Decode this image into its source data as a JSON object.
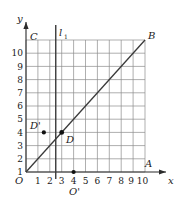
{
  "figure": {
    "axes": {
      "x_label": "x",
      "y_label": "y",
      "origin_label": "O",
      "x_ticks": [
        "1",
        "2",
        "3",
        "4",
        "5",
        "6",
        "7",
        "8",
        "9",
        "10"
      ],
      "y_ticks": [
        "1",
        "2",
        "3",
        "4",
        "5",
        "6",
        "7",
        "8",
        "9",
        "10"
      ],
      "x_range": [
        0,
        10
      ],
      "y_range": [
        0,
        10
      ]
    },
    "grid": {
      "color": "#8c8c8c",
      "spacing": 1,
      "visible": true
    },
    "lines": [
      {
        "name": "diagonal-line",
        "label": "",
        "from": [
          0,
          0
        ],
        "to": [
          10,
          10
        ],
        "color": "#3a3a3a"
      },
      {
        "name": "vertical-line-l1",
        "label": "l₁",
        "label_text": "l",
        "label_sub": "1",
        "x": 2.5,
        "from_y": 0,
        "to_y": 11.4,
        "color": "#3a3a3a"
      }
    ],
    "points": [
      {
        "name": "point-C",
        "label": "C",
        "x": 0,
        "y": 10,
        "marker": false,
        "label_dx": 4,
        "label_dy": -1
      },
      {
        "name": "point-B",
        "label": "B",
        "x": 10,
        "y": 10,
        "marker": false,
        "label_dx": 4,
        "label_dy": -2
      },
      {
        "name": "point-A",
        "label": "A",
        "x": 10,
        "y": 0.7,
        "marker": false,
        "label_dx": 2,
        "label_dy": 0
      },
      {
        "name": "point-D-prime",
        "label": "D'",
        "x": 1.5,
        "y": 3,
        "marker": true,
        "label_dx": -14,
        "label_dy": -4
      },
      {
        "name": "point-D",
        "label": "D",
        "x": 3,
        "y": 3,
        "marker": true,
        "label_dx": 4,
        "label_dy": 10
      },
      {
        "name": "point-O-prime",
        "label": "O'",
        "x": 4,
        "y": 0,
        "marker": true,
        "label_dx": -3,
        "label_dy": 20
      }
    ],
    "colors": {
      "background": "#ffffff",
      "grid": "#8c8c8c",
      "axis": "#2b2b2b",
      "line": "#3a3a3a",
      "text": "#1a1a1a",
      "marker": "#111111"
    }
  }
}
